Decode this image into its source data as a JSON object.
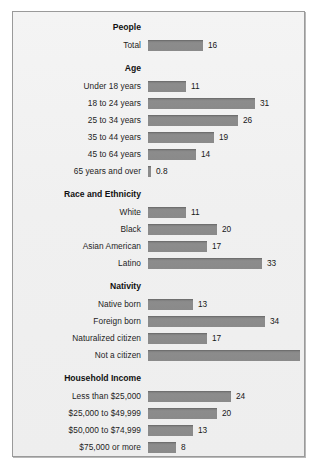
{
  "chart_data": {
    "type": "bar",
    "title": "",
    "xlabel": "",
    "ylabel": "",
    "orientation": "horizontal",
    "grid": false,
    "legend": false,
    "xlim": [
      0,
      44
    ],
    "value_unit": "percent",
    "sections": [
      {
        "header": "People",
        "header_note": "",
        "rows": [
          {
            "label": "Total",
            "value": 16,
            "value_text": "16"
          }
        ]
      },
      {
        "header": "Age",
        "header_note": "",
        "rows": [
          {
            "label": "Under 18 years",
            "value": 11,
            "value_text": "11"
          },
          {
            "label": "18 to 24 years",
            "value": 31,
            "value_text": "31"
          },
          {
            "label": "25 to 34 years",
            "value": 26,
            "value_text": "26"
          },
          {
            "label": "35 to 44 years",
            "value": 19,
            "value_text": "19"
          },
          {
            "label": "45 to 64 years",
            "value": 14,
            "value_text": "14"
          },
          {
            "label": "65 years and over",
            "value": 0.8,
            "value_text": "0.8"
          }
        ]
      },
      {
        "header": "Race and Ethnicity",
        "header_note": "",
        "rows": [
          {
            "label": "White",
            "value": 11,
            "value_text": "11"
          },
          {
            "label": "Black",
            "value": 20,
            "value_text": "20"
          },
          {
            "label": "Asian American",
            "value": 17,
            "value_text": "17"
          },
          {
            "label": "Latino",
            "value": 33,
            "value_text": "33"
          }
        ]
      },
      {
        "header": "Nativity",
        "header_note": "",
        "rows": [
          {
            "label": "Native born",
            "value": 13,
            "value_text": "13"
          },
          {
            "label": "Foreign born",
            "value": 34,
            "value_text": "34"
          },
          {
            "label": "Naturalized citizen",
            "value": 17,
            "value_text": "17"
          },
          {
            "label": "Not a citizen",
            "value": 44,
            "value_text": "44"
          }
        ]
      },
      {
        "header": "Household Income",
        "header_note": "",
        "rows": [
          {
            "label": "Less than $25,000",
            "value": 24,
            "value_text": "24"
          },
          {
            "label": "$25,000 to $49,999",
            "value": 20,
            "value_text": "20"
          },
          {
            "label": "$50,000 to $74,999",
            "value": 13,
            "value_text": "13"
          },
          {
            "label": "$75,000 or more",
            "value": 8,
            "value_text": "8"
          }
        ]
      },
      {
        "header": "Work Experience",
        "header_note": " (18 to 64 years old)",
        "header_align": "left",
        "rows": [
          {
            "label": "Worked during year",
            "value": 19,
            "value_text": "19"
          },
          {
            "label": "Worked full time",
            "value": 18,
            "value_text": "18"
          },
          {
            "label": "Worked part time",
            "value": 25,
            "value_text": "25"
          },
          {
            "label": "Did not work",
            "value": 26,
            "value_text": "26"
          }
        ]
      }
    ]
  },
  "style": {
    "bar_color": "#8a8a8a",
    "bar_edge_color": "#6f6f6f",
    "panel_bg": "#f0f0f0",
    "panel_border": "#9a9a9a",
    "text_color": "#1d1d1d"
  }
}
